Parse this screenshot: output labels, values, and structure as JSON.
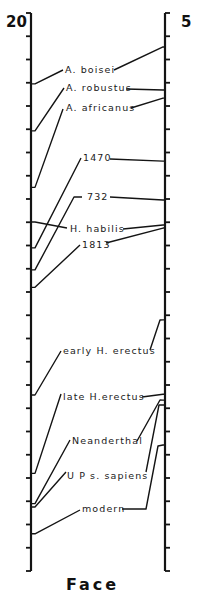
{
  "chart_data": {
    "type": "line",
    "title": "Face",
    "left_axis": {
      "top_label": "20",
      "tick_count": 24
    },
    "right_axis": {
      "top_label": "5",
      "tick_count": 24
    },
    "units": "tick intervals below axis top",
    "grid": false,
    "series": [
      {
        "name": "A. boisei",
        "left": 3.05,
        "right": 1.46
      },
      {
        "name": "A. robustus",
        "left": 5.07,
        "right": 3.31
      },
      {
        "name": "A. africanus",
        "left": 7.5,
        "right": 3.66
      },
      {
        "name": "1470",
        "left": 10.1,
        "right": 6.37
      },
      {
        "name": "732",
        "left": 11.05,
        "right": 8.04
      },
      {
        "name": "H. habilis",
        "left": 8.99,
        "right": 9.12
      },
      {
        "name": "1813",
        "left": 11.8,
        "right": 9.25
      },
      {
        "name": "early H. erectus",
        "left": 16.43,
        "right": 13.2
      },
      {
        "name": "late  H.erectus",
        "left": 19.8,
        "right": 16.4
      },
      {
        "name": "Neanderthal",
        "left": 21.1,
        "right": 16.65
      },
      {
        "name": "U P  s. sapiens",
        "left": 21.25,
        "right": 16.86
      },
      {
        "name": "modern",
        "left": 22.4,
        "right": 18.58
      }
    ]
  }
}
